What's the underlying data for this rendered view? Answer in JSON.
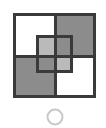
{
  "figure": {
    "title": "Overlapping squares with circle",
    "canvas": {
      "width": 106,
      "height": 128,
      "background": "#ffffff"
    },
    "colors": {
      "stroke_dark": "#3a3a3a",
      "fill_gray": "#8c8c8c",
      "fill_white": "#ffffff",
      "circle_stroke": "#c8c8c8"
    },
    "outer_square": {
      "label": "Outer square",
      "x": 13,
      "y": 13,
      "width": 83,
      "height": 85,
      "stroke_width": 3,
      "divider_x": 55,
      "divider_y": 56
    },
    "quadrants": [
      {
        "name": "top-left",
        "fill": "#ffffff",
        "x": 13,
        "y": 13,
        "width": 42,
        "height": 43
      },
      {
        "name": "top-right",
        "fill": "#8c8c8c",
        "x": 55,
        "y": 13,
        "width": 41,
        "height": 43
      },
      {
        "name": "bottom-left",
        "fill": "#8c8c8c",
        "x": 13,
        "y": 56,
        "width": 42,
        "height": 42
      },
      {
        "name": "bottom-right",
        "fill": "#ffffff",
        "x": 55,
        "y": 56,
        "width": 41,
        "height": 42
      }
    ],
    "inner_square": {
      "label": "Inner overlapping square",
      "x": 36,
      "y": 35,
      "width": 37,
      "height": 38,
      "fill": "#8c8c8c",
      "fill_opacity": 0.6,
      "stroke": "#3a3a3a",
      "stroke_width": 3
    },
    "circle": {
      "label": "Circle marker",
      "cx": 55,
      "cy": 117,
      "r": 7.5,
      "stroke": "#c8c8c8",
      "stroke_width": 2,
      "fill": "none"
    }
  }
}
